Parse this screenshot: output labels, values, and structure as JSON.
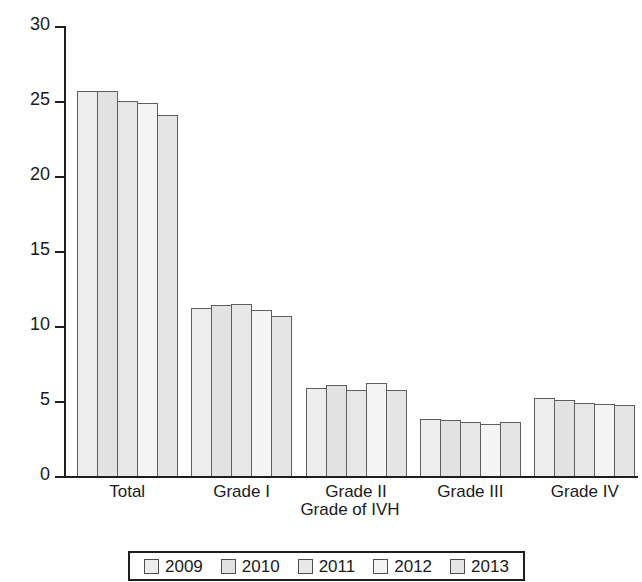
{
  "chart_data": {
    "type": "bar",
    "title": "",
    "xlabel": "Grade of IVH",
    "ylabel": "Percentage of infants with IVH",
    "categories": [
      "Total",
      "Grade I",
      "Grade II",
      "Grade III",
      "Grade IV"
    ],
    "series": [
      {
        "name": "2009",
        "color": "#ededed",
        "values": [
          25.7,
          11.2,
          5.9,
          3.8,
          5.2
        ]
      },
      {
        "name": "2010",
        "color": "#e2e2e2",
        "values": [
          25.7,
          11.4,
          6.05,
          3.75,
          5.1
        ]
      },
      {
        "name": "2011",
        "color": "#e7e7e7",
        "values": [
          25.0,
          11.5,
          5.75,
          3.6,
          4.85
        ]
      },
      {
        "name": "2012",
        "color": "#f4f4f4",
        "values": [
          24.9,
          11.1,
          6.2,
          3.5,
          4.8
        ]
      },
      {
        "name": "2013",
        "color": "#e5e5e5",
        "values": [
          24.1,
          10.7,
          5.75,
          3.6,
          4.75
        ]
      }
    ],
    "ylim": [
      0,
      30
    ],
    "yticks": [
      "0",
      "5",
      "10",
      "15",
      "20",
      "25",
      "30"
    ],
    "ytick_values": [
      0,
      5,
      10,
      15,
      20,
      25,
      30
    ],
    "grid": false,
    "legend_position": "bottom"
  },
  "legend": {
    "entries": [
      {
        "label": "2009"
      },
      {
        "label": "2010"
      },
      {
        "label": "2011"
      },
      {
        "label": "2012"
      },
      {
        "label": "2013"
      }
    ]
  }
}
